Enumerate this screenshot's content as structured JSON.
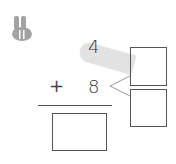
{
  "icon": {
    "name": "bunny-icon",
    "color": "#a3a3a3"
  },
  "problem": {
    "operator": "+",
    "top_number": "4",
    "bottom_number": "8",
    "decompose_boxes": [
      "",
      ""
    ],
    "answer_box": ""
  },
  "colors": {
    "highlight_band": "#e2e2e2",
    "lines": "#555555",
    "connector": "#999999"
  }
}
